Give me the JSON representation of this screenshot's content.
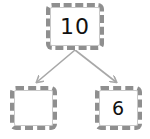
{
  "diagram": {
    "type": "number-bond",
    "whole": {
      "value": "10"
    },
    "parts": [
      {
        "value": ""
      },
      {
        "value": "6"
      }
    ],
    "colors": {
      "box_border": "#8f8f8f",
      "arrow": "#a8a8a8",
      "text": "#111111",
      "background": "#ffffff"
    }
  }
}
